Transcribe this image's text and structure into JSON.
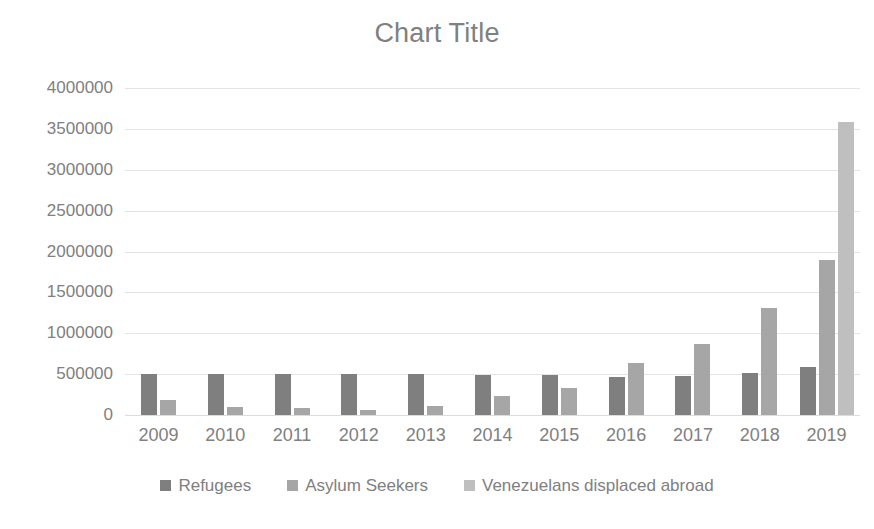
{
  "chart_data": {
    "type": "bar",
    "title": "Chart Title",
    "xlabel": "",
    "ylabel": "",
    "ylim": [
      0,
      4000000
    ],
    "ytick_step": 500000,
    "ytick_labels": [
      "4000000",
      "3500000",
      "3000000",
      "2500000",
      "2000000",
      "1500000",
      "1000000",
      "500000",
      "0"
    ],
    "ytick_values": [
      4000000,
      3500000,
      3000000,
      2500000,
      2000000,
      1500000,
      1000000,
      500000,
      0
    ],
    "grid": true,
    "legend_position": "bottom",
    "categories": [
      "2009",
      "2010",
      "2011",
      "2012",
      "2013",
      "2014",
      "2015",
      "2016",
      "2017",
      "2018",
      "2019"
    ],
    "series": [
      {
        "name": "Refugees",
        "color": "#7f7f7f",
        "values": [
          500000,
          500000,
          500000,
          500000,
          505000,
          495000,
          490000,
          460000,
          480000,
          520000,
          590000
        ]
      },
      {
        "name": "Asylum Seekers",
        "color": "#a6a6a6",
        "values": [
          180000,
          100000,
          90000,
          60000,
          110000,
          230000,
          330000,
          640000,
          870000,
          1310000,
          1900000
        ]
      },
      {
        "name": "Venezuelans displaced abroad",
        "color": "#bfbfbf",
        "values": [
          0,
          0,
          0,
          0,
          0,
          0,
          0,
          0,
          0,
          0,
          3580000
        ]
      }
    ]
  },
  "legend": {
    "items": [
      {
        "label": "Refugees",
        "color": "#7f7f7f"
      },
      {
        "label": "Asylum Seekers",
        "color": "#a6a6a6"
      },
      {
        "label": "Venezuelans displaced abroad",
        "color": "#bfbfbf"
      }
    ]
  }
}
